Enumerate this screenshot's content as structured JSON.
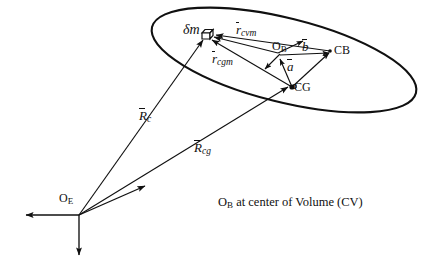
{
  "figure": {
    "background_color": "#ffffff",
    "stroke_color": "#101010",
    "width": 435,
    "height": 264
  },
  "labels": {
    "delta_mass": "δm",
    "r_cvm": {
      "symbol": "r",
      "subscript": "cvm"
    },
    "r_cgm": {
      "symbol": "r",
      "subscript": "cgm"
    },
    "R_c": {
      "symbol": "R",
      "subscript": "c"
    },
    "R_cg": {
      "symbol": "R",
      "subscript": "cg"
    },
    "vector_b": {
      "symbol": "b"
    },
    "vector_a": {
      "symbol": "a"
    },
    "origin_body": {
      "symbol": "O",
      "subscript": "B"
    },
    "origin_earth": {
      "symbol": "O",
      "subscript": "E"
    },
    "center_of_buoyancy": "CB",
    "center_of_gravity": "CG"
  },
  "caption": {
    "symbol": "O",
    "subscript": "B",
    "text": " at center of Volume (CV)"
  },
  "points": {
    "delta_m": {
      "x": 207,
      "y": 35
    },
    "O_B": {
      "x": 278,
      "y": 53
    },
    "CB": {
      "x": 330,
      "y": 51
    },
    "CG": {
      "x": 292,
      "y": 87
    },
    "O_E": {
      "x": 79,
      "y": 215
    }
  },
  "vectors": [
    {
      "name": "R_c",
      "from": "O_E",
      "to": "delta_m",
      "label": "R_c"
    },
    {
      "name": "R_cg",
      "from": "O_E",
      "to": "CG",
      "label": "R_cg"
    },
    {
      "name": "r_cvm",
      "from": "O_B",
      "to": "delta_m",
      "label": "r_cvm"
    },
    {
      "name": "r_cgm",
      "from": "CG",
      "to": "delta_m",
      "label": "r_cgm"
    },
    {
      "name": "b",
      "from": "O_B",
      "to": "CB",
      "label": "vector_b"
    },
    {
      "name": "a",
      "from": "CG",
      "to": "O_B",
      "label": "vector_a"
    },
    {
      "name": "cg_to_cb",
      "from": "CG",
      "to": "CB",
      "label": ""
    }
  ],
  "axes": [
    {
      "name": "x-axis-diagonal",
      "direction": "up-right"
    },
    {
      "name": "y-axis-left",
      "direction": "left"
    },
    {
      "name": "z-axis-down",
      "direction": "down"
    }
  ],
  "body_shape": {
    "name": "ellipse-body-outline",
    "center_x": 284,
    "center_y": 60,
    "semi_major": 136,
    "semi_minor": 42,
    "rotation_deg": 14
  }
}
